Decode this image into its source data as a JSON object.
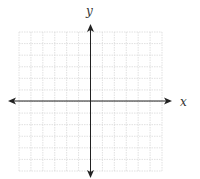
{
  "diagram": {
    "type": "coordinate-plane",
    "x_axis_label": "x",
    "y_axis_label": "y",
    "grid": {
      "columns": 12,
      "rows": 12,
      "left": 19,
      "top": 32,
      "right": 162,
      "bottom": 171,
      "color": "#d9d9d9",
      "style": "dotted"
    },
    "axes": {
      "origin_x": 90.5,
      "origin_y": 101,
      "x_start": 8,
      "x_end": 172,
      "y_start": 24,
      "y_end": 178,
      "color": "#222222",
      "arrows": "both-ends"
    }
  }
}
